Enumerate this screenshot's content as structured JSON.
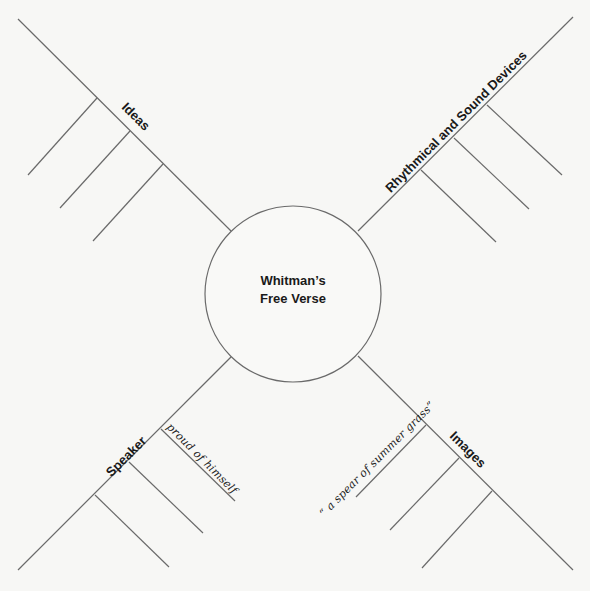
{
  "diagram": {
    "type": "spider-map",
    "center": {
      "line1": "Whitman’s",
      "line2": "Free Verse"
    },
    "arms": [
      {
        "id": "ideas",
        "label": "Ideas",
        "position": "upper-left",
        "branches": [
          "",
          "",
          ""
        ]
      },
      {
        "id": "rhythmical",
        "label": "Rhythmical and Sound Devices",
        "position": "upper-right",
        "branches": [
          "",
          "",
          ""
        ]
      },
      {
        "id": "speaker",
        "label": "Speaker",
        "position": "lower-left",
        "branches": [
          "proud of himself",
          "",
          ""
        ]
      },
      {
        "id": "images",
        "label": "Images",
        "position": "lower-right",
        "branches": [
          "“ a spear of summer grass”",
          "",
          ""
        ]
      }
    ],
    "colors": {
      "background": "#f7f7f5",
      "line": "#6a6a6a",
      "text": "#1a1a1a"
    }
  }
}
